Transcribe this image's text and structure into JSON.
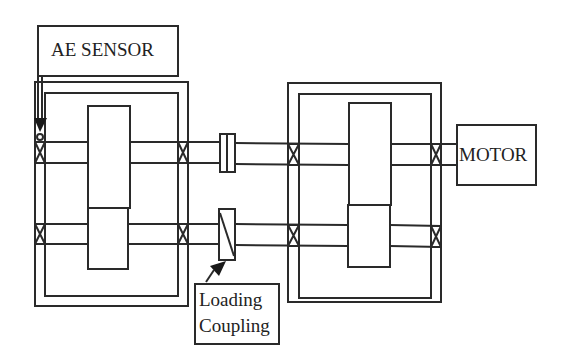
{
  "diagram": {
    "type": "gearbox test rig schematic",
    "labels": {
      "ae_sensor": "AE SENSOR",
      "motor": "MOTOR",
      "loading_coupling_line1": "Loading",
      "loading_coupling_line2": "Coupling"
    },
    "components": [
      {
        "id": "ae-sensor",
        "label": "AE SENSOR",
        "points_to": "left gearbox upper bearing"
      },
      {
        "id": "test-gearbox",
        "position": "left",
        "gears": 2,
        "bearings": 4
      },
      {
        "id": "shaft-coupling",
        "position": "upper shaft between gearboxes"
      },
      {
        "id": "loading-coupling",
        "label": "Loading Coupling",
        "position": "lower shaft between gearboxes"
      },
      {
        "id": "slave-gearbox",
        "position": "right",
        "gears": 2,
        "bearings": 4
      },
      {
        "id": "motor",
        "label": "MOTOR",
        "connected_to": "upper shaft, right"
      }
    ],
    "colors": {
      "line": "#2a2a2a",
      "background": "#ffffff"
    }
  }
}
